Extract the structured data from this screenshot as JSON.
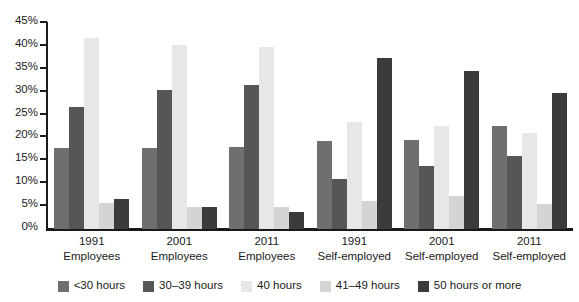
{
  "chart_data": {
    "type": "bar",
    "title": "",
    "xlabel": "",
    "ylabel": "",
    "ylim": [
      0,
      45
    ],
    "grid": false,
    "legend_position": "bottom",
    "y_ticks": [
      "0%",
      "5%",
      "10%",
      "15%",
      "20%",
      "25%",
      "30%",
      "35%",
      "40%",
      "45%"
    ],
    "y_tick_values": [
      0,
      5,
      10,
      15,
      20,
      25,
      30,
      35,
      40,
      45
    ],
    "categories": [
      {
        "year": "1991",
        "status": "Employees"
      },
      {
        "year": "2001",
        "status": "Employees"
      },
      {
        "year": "2011",
        "status": "Employees"
      },
      {
        "year": "1991",
        "status": "Self-employed"
      },
      {
        "year": "2001",
        "status": "Self-employed"
      },
      {
        "year": "2011",
        "status": "Self-employed"
      }
    ],
    "series": [
      {
        "name": "<30 hours",
        "color": "#6f6f6f",
        "values": [
          17.7,
          17.7,
          18.0,
          19.3,
          19.5,
          22.4
        ]
      },
      {
        "name": "30–39 hours",
        "color": "#565656",
        "values": [
          26.6,
          30.3,
          31.5,
          11.0,
          13.7,
          16.0
        ]
      },
      {
        "name": "40 hours",
        "color": "#e7e7e7",
        "values": [
          41.8,
          40.3,
          39.8,
          23.4,
          22.4,
          20.9
        ]
      },
      {
        "name": "41–49 hours",
        "color": "#d4d4d4",
        "values": [
          5.6,
          4.8,
          4.8,
          6.2,
          7.3,
          5.4
        ]
      },
      {
        "name": "50 hours or more",
        "color": "#3b3b3b",
        "values": [
          6.5,
          4.8,
          3.7,
          37.3,
          34.6,
          29.7
        ]
      }
    ]
  }
}
